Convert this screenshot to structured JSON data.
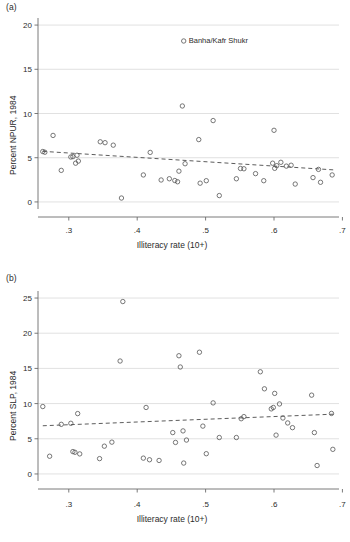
{
  "figure": {
    "xlabel": "Illiteracy rate (10+)",
    "xticks": [
      ".3",
      ".4",
      ".5",
      ".6",
      ".7"
    ],
    "panel_a_tag": "(a)",
    "panel_b_tag": "(b)"
  },
  "chart_data": [
    {
      "type": "scatter",
      "panel": "(a)",
      "title": "",
      "xlabel": "Illiteracy rate (10+)",
      "ylabel": "Percent NPUR, 1984",
      "xlim": [
        0.255,
        0.695
      ],
      "ylim": [
        -0.8,
        20.8
      ],
      "xticks": [
        0.3,
        0.4,
        0.5,
        0.6,
        0.7
      ],
      "xticklabels": [
        ".3",
        ".4",
        ".5",
        ".6",
        ".7"
      ],
      "yticks": [
        0,
        5,
        10,
        15,
        20
      ],
      "yticklabels": [
        "0",
        "5",
        "10",
        "15",
        "20"
      ],
      "grid": "horizontal",
      "legend": "none",
      "marker": "open-circle",
      "annotations": [
        {
          "text": "Banha/Kafr Shukr",
          "x": 0.468,
          "y": 18.2
        }
      ],
      "trendline": {
        "style": "dashed",
        "x": [
          0.262,
          0.688
        ],
        "y": [
          5.72,
          3.62
        ]
      },
      "points": [
        {
          "x": 0.262,
          "y": 5.7
        },
        {
          "x": 0.265,
          "y": 5.62
        },
        {
          "x": 0.277,
          "y": 7.52
        },
        {
          "x": 0.289,
          "y": 3.57
        },
        {
          "x": 0.303,
          "y": 5.08
        },
        {
          "x": 0.306,
          "y": 5.12
        },
        {
          "x": 0.31,
          "y": 4.38
        },
        {
          "x": 0.312,
          "y": 5.28
        },
        {
          "x": 0.314,
          "y": 4.62
        },
        {
          "x": 0.346,
          "y": 6.8
        },
        {
          "x": 0.353,
          "y": 6.7
        },
        {
          "x": 0.365,
          "y": 6.42
        },
        {
          "x": 0.377,
          "y": 0.44
        },
        {
          "x": 0.409,
          "y": 3.05
        },
        {
          "x": 0.419,
          "y": 5.6
        },
        {
          "x": 0.435,
          "y": 2.48
        },
        {
          "x": 0.447,
          "y": 2.62
        },
        {
          "x": 0.455,
          "y": 2.42
        },
        {
          "x": 0.459,
          "y": 2.28
        },
        {
          "x": 0.461,
          "y": 3.48
        },
        {
          "x": 0.466,
          "y": 10.85
        },
        {
          "x": 0.468,
          "y": 18.2
        },
        {
          "x": 0.47,
          "y": 4.32
        },
        {
          "x": 0.49,
          "y": 7.05
        },
        {
          "x": 0.492,
          "y": 2.12
        },
        {
          "x": 0.501,
          "y": 2.4
        },
        {
          "x": 0.511,
          "y": 9.2
        },
        {
          "x": 0.52,
          "y": 0.72
        },
        {
          "x": 0.545,
          "y": 2.62
        },
        {
          "x": 0.551,
          "y": 3.78
        },
        {
          "x": 0.556,
          "y": 3.75
        },
        {
          "x": 0.573,
          "y": 3.2
        },
        {
          "x": 0.585,
          "y": 2.4
        },
        {
          "x": 0.598,
          "y": 4.38
        },
        {
          "x": 0.6,
          "y": 8.1
        },
        {
          "x": 0.601,
          "y": 3.8
        },
        {
          "x": 0.604,
          "y": 4.1
        },
        {
          "x": 0.61,
          "y": 4.48
        },
        {
          "x": 0.618,
          "y": 4.05
        },
        {
          "x": 0.625,
          "y": 4.15
        },
        {
          "x": 0.631,
          "y": 2.02
        },
        {
          "x": 0.657,
          "y": 2.75
        },
        {
          "x": 0.665,
          "y": 3.68
        },
        {
          "x": 0.668,
          "y": 2.22
        },
        {
          "x": 0.685,
          "y": 3.05
        }
      ]
    },
    {
      "type": "scatter",
      "panel": "(b)",
      "title": "",
      "xlabel": "Illiteracy rate (10+)",
      "ylabel": "Percent SLP, 1984",
      "xlim": [
        0.255,
        0.695
      ],
      "ylim": [
        -1.0,
        26.0
      ],
      "xticks": [
        0.3,
        0.4,
        0.5,
        0.6,
        0.7
      ],
      "xticklabels": [
        ".3",
        ".4",
        ".5",
        ".6",
        ".7"
      ],
      "yticks": [
        0,
        5,
        10,
        15,
        20,
        25
      ],
      "yticklabels": [
        "0",
        "5",
        "10",
        "15",
        "20",
        "25"
      ],
      "grid": "horizontal",
      "legend": "none",
      "marker": "open-circle",
      "annotations": [],
      "trendline": {
        "style": "dashed",
        "x": [
          0.262,
          0.688
        ],
        "y": [
          6.85,
          8.5
        ]
      },
      "points": [
        {
          "x": 0.262,
          "y": 9.58
        },
        {
          "x": 0.272,
          "y": 2.52
        },
        {
          "x": 0.289,
          "y": 7.05
        },
        {
          "x": 0.303,
          "y": 7.2
        },
        {
          "x": 0.306,
          "y": 3.18
        },
        {
          "x": 0.309,
          "y": 3.08
        },
        {
          "x": 0.313,
          "y": 8.58
        },
        {
          "x": 0.316,
          "y": 2.85
        },
        {
          "x": 0.345,
          "y": 2.18
        },
        {
          "x": 0.352,
          "y": 3.95
        },
        {
          "x": 0.363,
          "y": 4.52
        },
        {
          "x": 0.375,
          "y": 16.05
        },
        {
          "x": 0.379,
          "y": 24.5
        },
        {
          "x": 0.409,
          "y": 2.25
        },
        {
          "x": 0.413,
          "y": 9.45
        },
        {
          "x": 0.418,
          "y": 2.02
        },
        {
          "x": 0.432,
          "y": 1.92
        },
        {
          "x": 0.452,
          "y": 5.88
        },
        {
          "x": 0.456,
          "y": 4.48
        },
        {
          "x": 0.461,
          "y": 16.8
        },
        {
          "x": 0.463,
          "y": 15.2
        },
        {
          "x": 0.467,
          "y": 6.12
        },
        {
          "x": 0.468,
          "y": 1.55
        },
        {
          "x": 0.472,
          "y": 4.82
        },
        {
          "x": 0.491,
          "y": 17.3
        },
        {
          "x": 0.496,
          "y": 6.8
        },
        {
          "x": 0.501,
          "y": 2.88
        },
        {
          "x": 0.511,
          "y": 10.1
        },
        {
          "x": 0.52,
          "y": 5.18
        },
        {
          "x": 0.545,
          "y": 5.18
        },
        {
          "x": 0.552,
          "y": 7.85
        },
        {
          "x": 0.556,
          "y": 8.15
        },
        {
          "x": 0.58,
          "y": 14.52
        },
        {
          "x": 0.586,
          "y": 12.1
        },
        {
          "x": 0.596,
          "y": 9.25
        },
        {
          "x": 0.599,
          "y": 9.45
        },
        {
          "x": 0.601,
          "y": 11.45
        },
        {
          "x": 0.603,
          "y": 5.52
        },
        {
          "x": 0.608,
          "y": 9.95
        },
        {
          "x": 0.613,
          "y": 7.95
        },
        {
          "x": 0.62,
          "y": 7.25
        },
        {
          "x": 0.627,
          "y": 6.58
        },
        {
          "x": 0.655,
          "y": 11.2
        },
        {
          "x": 0.659,
          "y": 5.88
        },
        {
          "x": 0.663,
          "y": 1.2
        },
        {
          "x": 0.684,
          "y": 8.6
        },
        {
          "x": 0.686,
          "y": 3.5
        }
      ]
    }
  ]
}
